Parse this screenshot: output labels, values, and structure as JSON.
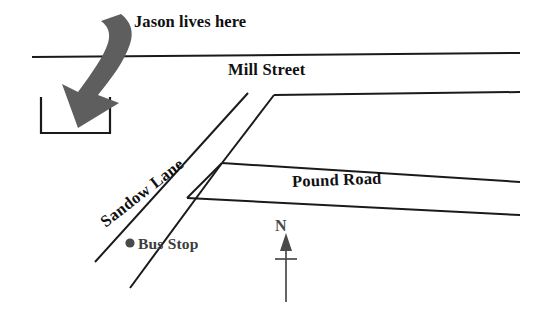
{
  "map": {
    "title": "Street map showing Jason's house, Mill Street, Sandow Lane and Pound Road",
    "background_color": "#ffffff",
    "road_color": "#1a1a1a",
    "arrow_color": "#5e5e5e",
    "bus_stop_color": "#4a4a4a",
    "compass_color": "#4a4a4a"
  },
  "labels": {
    "jason": "Jason lives here",
    "mill_street": "Mill Street",
    "pound_road": "Pound Road",
    "sandow_lane": "Sandow Lane",
    "bus_stop": "Bus Stop",
    "north": "N"
  },
  "features": {
    "house": {
      "name": "Jason's house",
      "shape": "rectangle"
    },
    "pointer_arrow": {
      "name": "curved arrow pointing to house",
      "direction": "down-left",
      "color": "#5e5e5e"
    },
    "bus_stop_marker": {
      "name": "bus stop dot",
      "shape": "filled circle",
      "color": "#4a4a4a"
    },
    "compass": {
      "name": "north arrow",
      "points_to": "N",
      "orientation": "up"
    }
  },
  "roads": [
    {
      "name": "Mill Street",
      "orientation": "east-west",
      "label": "Mill Street"
    },
    {
      "name": "Sandow Lane",
      "orientation": "northeast-southwest diagonal",
      "label": "Sandow Lane"
    },
    {
      "name": "Pound Road",
      "orientation": "east-west",
      "label": "Pound Road"
    }
  ]
}
